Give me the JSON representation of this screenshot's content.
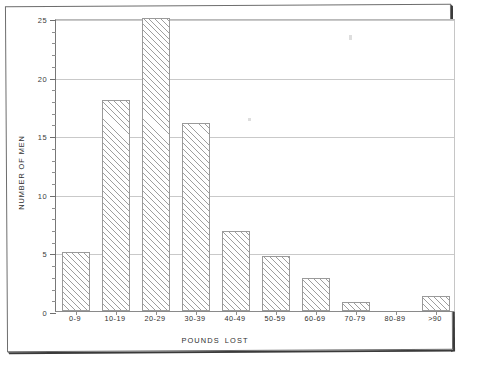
{
  "chart_data": {
    "type": "bar",
    "title": "",
    "subtitle": "",
    "xlabel": "POUNDS  LOST",
    "ylabel": "NUMBER OF MEN",
    "categories": [
      "0-9",
      "10-19",
      "20-29",
      "30-39",
      "40-49",
      "50-59",
      "60-69",
      "70-79",
      "80-89",
      ">90"
    ],
    "values": [
      5,
      18,
      25,
      16,
      6.8,
      4.7,
      2.8,
      0.8,
      0,
      1.3
    ],
    "ylim": [
      0,
      25
    ],
    "xlim_note": "categorical, 10 equal-width bins",
    "y_major_ticks": [
      0,
      5,
      10,
      15,
      20,
      25
    ],
    "y_minor_tick_step": 1,
    "y_tick_labels": [
      "0",
      "5",
      "10",
      "15",
      "20",
      "25"
    ],
    "grid": "horizontal major only",
    "legend": "none",
    "annotations": [],
    "bar_style": "diagonal-hatch-45deg",
    "colors": {
      "bar_outline": "#9a9a9a",
      "bar_hatch": "#9e9e9e",
      "bar_fill": "#ffffff",
      "gridline": "#c9c9c9",
      "axis": "#777777",
      "text": "#2f2f2f",
      "page_border": "#3a3a3a",
      "background": "#ffffff"
    }
  },
  "axes": {
    "y_title": "NUMBER OF MEN",
    "x_title": "POUNDS  LOST",
    "y_ticks": [
      {
        "value": 25,
        "label": "25"
      },
      {
        "value": 20,
        "label": "20"
      },
      {
        "value": 15,
        "label": "15"
      },
      {
        "value": 10,
        "label": "10"
      },
      {
        "value": 5,
        "label": "5"
      },
      {
        "value": 0,
        "label": "0"
      }
    ]
  },
  "figure": {
    "media": "scanned printed page",
    "has_border_frame": true
  }
}
